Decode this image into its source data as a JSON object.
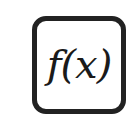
{
  "icon": {
    "name": "function-icon",
    "label": "f(x)",
    "border_color": "#222222",
    "text_color": "#1a1a1a",
    "background": "#ffffff"
  }
}
